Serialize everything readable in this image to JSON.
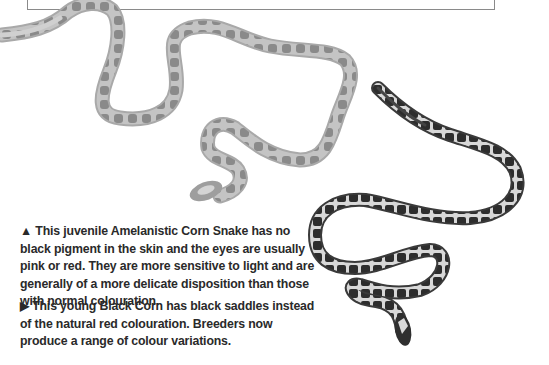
{
  "page": {
    "captions": [
      {
        "marker": "▲",
        "text": "This juvenile Amelanistic Corn Snake has no black pigment in the skin and the eyes are usually pink or red. They are more sensitive to light and are generally of a more delicate disposition than those with normal colouration."
      },
      {
        "marker": "▶",
        "text": "This young Black Corn has black saddles instead of the natural red colouration. Breeders now produce a range of colour variations."
      }
    ],
    "images": [
      {
        "name": "amelanistic-corn-snake",
        "description": "Juvenile Amelanistic Corn Snake photo"
      },
      {
        "name": "black-corn-snake",
        "description": "Young Black Corn Snake photo"
      }
    ],
    "colors": {
      "text": "#2a2a2a",
      "amelanistic_body": "#bdbdbd",
      "amelanistic_saddle": "#8c8c8c",
      "black_corn_body": "#cfcfcf",
      "black_corn_saddle": "#2e2e2e",
      "frame_border": "#8a8a8a"
    }
  }
}
